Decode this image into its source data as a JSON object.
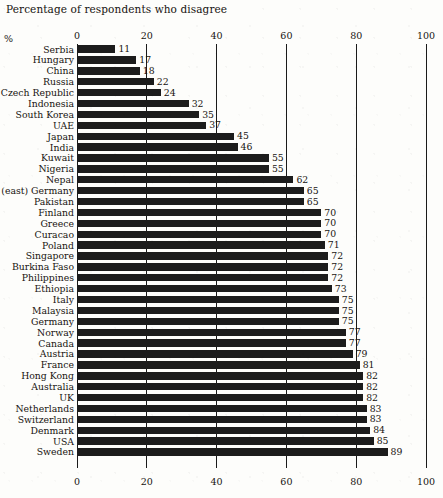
{
  "chart_data": {
    "type": "bar",
    "orientation": "horizontal",
    "title": "Percentage of respondents who disagree",
    "xlabel": "%",
    "ylabel": "",
    "xlim": [
      0,
      100
    ],
    "xticks": [
      0,
      20,
      40,
      60,
      80,
      100
    ],
    "xtick_labels": [
      "0",
      "20",
      "40",
      "60",
      "80",
      "100"
    ],
    "axis_positions": [
      "top",
      "bottom"
    ],
    "grid": true,
    "grid_axis": "x",
    "legend": false,
    "value_labels": true,
    "bar_color": "#1c1c1c",
    "categories": [
      "Serbia",
      "Hungary",
      "China",
      "Russia",
      "Czech Republic",
      "Indonesia",
      "South Korea",
      "UAE",
      "Japan",
      "India",
      "Kuwait",
      "Nigeria",
      "Nepal",
      "(east) Germany",
      "Pakistan",
      "Finland",
      "Greece",
      "Curacao",
      "Poland",
      "Singapore",
      "Burkina Faso",
      "Philippines",
      "Ethiopia",
      "Italy",
      "Malaysia",
      "Germany",
      "Norway",
      "Canada",
      "Austria",
      "France",
      "Hong Kong",
      "Australia",
      "UK",
      "Netherlands",
      "Switzerland",
      "Denmark",
      "USA",
      "Sweden"
    ],
    "values": [
      11,
      17,
      18,
      22,
      24,
      32,
      35,
      37,
      45,
      46,
      55,
      55,
      62,
      65,
      65,
      70,
      70,
      70,
      71,
      72,
      72,
      72,
      73,
      75,
      75,
      75,
      77,
      77,
      79,
      81,
      82,
      82,
      82,
      83,
      83,
      84,
      85,
      89
    ]
  }
}
